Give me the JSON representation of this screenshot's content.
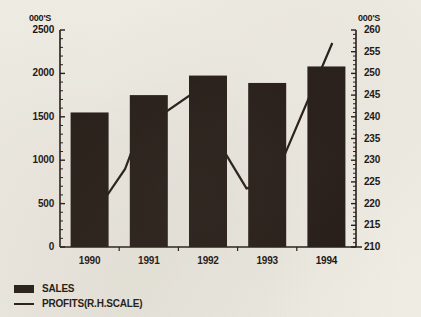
{
  "chart_data": {
    "type": "bar",
    "title": "",
    "xlabel": "",
    "ylabel": "000'S",
    "categories": [
      "1990",
      "1991",
      "1992",
      "1993",
      "1994"
    ],
    "grid": false,
    "legend_position": "bottom-left",
    "left_axis": {
      "unit_label": "000'S",
      "ticks": [
        0,
        500,
        1000,
        1500,
        2000,
        2500
      ],
      "tick_labels": [
        "0",
        "500",
        "1000",
        "1500",
        "2000",
        "2500"
      ],
      "ylim": [
        0,
        2500
      ],
      "minor_tick_step": 100
    },
    "right_axis": {
      "unit_label": "000'S",
      "ticks": [
        210,
        215,
        220,
        225,
        230,
        235,
        240,
        245,
        250,
        255,
        260
      ],
      "tick_labels": [
        "210",
        "215",
        "220",
        "225",
        "230",
        "235",
        "240",
        "245",
        "250",
        "255",
        "260"
      ],
      "ylim": [
        210,
        260
      ],
      "minor_tick_step": 1
    },
    "series": [
      {
        "name": "SALES",
        "type": "bar",
        "axis": "left",
        "color": "#241b16",
        "values": [
          1550,
          1750,
          1975,
          1890,
          2080
        ]
      },
      {
        "name": "PROFITS(R.H.SCALE)",
        "type": "line",
        "axis": "right",
        "color": "#241b16",
        "values": [
          216,
          237,
          245,
          223.5,
          257
        ],
        "vertices": [
          {
            "x_frac": 0.1,
            "value": 216
          },
          {
            "x_frac": 0.22,
            "value": 228
          },
          {
            "x_frac": 0.27,
            "value": 237
          },
          {
            "x_frac": 0.44,
            "value": 245
          },
          {
            "x_frac": 0.63,
            "value": 223.5
          },
          {
            "x_frac": 0.72,
            "value": 225
          },
          {
            "x_frac": 0.92,
            "value": 257
          }
        ]
      }
    ]
  },
  "legend": {
    "items": [
      {
        "label": "SALES",
        "marker": "bar-swatch"
      },
      {
        "label": "PROFITS(R.H.SCALE)",
        "marker": "line-swatch"
      }
    ]
  }
}
